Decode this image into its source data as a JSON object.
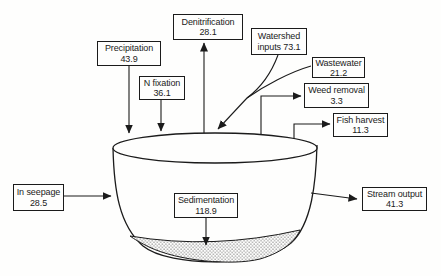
{
  "diagram": {
    "kind": "flow-diagram",
    "colors": {
      "ink": "#1b1b1b",
      "paper": "#fefefd"
    },
    "nodes": [
      {
        "id": "denitrification",
        "line1": "Denitrification",
        "line2": "28.1",
        "flow": "out"
      },
      {
        "id": "precipitation",
        "line1": "Precipitation",
        "line2": "43.9",
        "flow": "in"
      },
      {
        "id": "n-fixation",
        "line1": "N fixation",
        "line2": "36.1",
        "flow": "in"
      },
      {
        "id": "watershed-inputs",
        "line1": "Watershed",
        "line2": "inputs 73.1",
        "flow": "in"
      },
      {
        "id": "wastewater",
        "line1": "Wastewater",
        "line2": "21.2",
        "flow": "in"
      },
      {
        "id": "weed-removal",
        "line1": "Weed removal",
        "line2": "3.3",
        "flow": "out"
      },
      {
        "id": "fish-harvest",
        "line1": "Fish harvest",
        "line2": "11.3",
        "flow": "out"
      },
      {
        "id": "in-seepage",
        "line1": "In seepage",
        "line2": "28.5",
        "flow": "in"
      },
      {
        "id": "sedimentation",
        "line1": "Sedimentation",
        "line2": "118.9",
        "flow": "internal"
      },
      {
        "id": "stream-output",
        "line1": "Stream output",
        "line2": "41.3",
        "flow": "out"
      }
    ]
  }
}
